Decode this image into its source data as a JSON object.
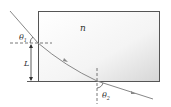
{
  "diagram": {
    "type": "refraction-through-slab",
    "labels": {
      "medium": "n",
      "incident_angle": "θ",
      "incident_sub": "1",
      "exit_angle": "θ",
      "exit_sub": "2",
      "length": "L"
    },
    "colors": {
      "slab_fill_light": "#ffffff",
      "slab_fill_dark": "#d9d9d9",
      "slab_border": "#555555",
      "ray": "#888888",
      "text": "#333333"
    }
  }
}
